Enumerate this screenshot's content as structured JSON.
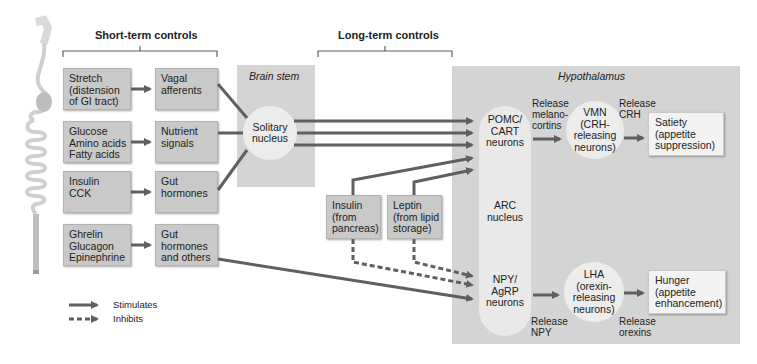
{
  "headings": {
    "short_term": "Short-term controls",
    "long_term": "Long-term controls"
  },
  "panels": {
    "brain_stem": "Brain stem",
    "hypothalamus": "Hypothalamus"
  },
  "inputs": [
    {
      "lines": [
        "Stretch",
        "(distension",
        "of GI tract)"
      ]
    },
    {
      "lines": [
        "Glucose",
        "Amino acids",
        "Fatty acids"
      ]
    },
    {
      "lines": [
        "Insulin",
        "CCK"
      ]
    },
    {
      "lines": [
        "Ghrelin",
        "Glucagon",
        "Epinephrine"
      ]
    }
  ],
  "signals": [
    {
      "lines": [
        "Vagal",
        "afferents"
      ]
    },
    {
      "lines": [
        "Nutrient",
        "signals"
      ]
    },
    {
      "lines": [
        "Gut",
        "hormones"
      ]
    },
    {
      "lines": [
        "Gut",
        "hormones",
        "and others"
      ]
    }
  ],
  "solitary_nucleus": {
    "lines": [
      "Solitary",
      "nucleus"
    ]
  },
  "long_term_inputs": [
    {
      "lines": [
        "Insulin",
        "(from",
        "pancreas)"
      ]
    },
    {
      "lines": [
        "Leptin",
        "(from lipid",
        "storage)"
      ]
    }
  ],
  "hypothalamus": {
    "pomc": {
      "lines": [
        "POMC/",
        "CART",
        "neurons"
      ]
    },
    "arc": {
      "lines": [
        "ARC",
        "nucleus"
      ]
    },
    "npy": {
      "lines": [
        "NPY/",
        "AgRP",
        "neurons"
      ]
    },
    "vmn": {
      "lines": [
        "VMN",
        "(CRH-",
        "releasing",
        "neurons)"
      ]
    },
    "lha": {
      "lines": [
        "LHA",
        "(orexin-",
        "releasing",
        "neurons)"
      ]
    },
    "release_melanocortins": {
      "lines": [
        "Release",
        "melano-",
        "cortins"
      ]
    },
    "release_crh": {
      "lines": [
        "Release",
        "CRH"
      ]
    },
    "release_npy": {
      "lines": [
        "Release",
        "NPY"
      ]
    },
    "release_orexins": {
      "lines": [
        "Release",
        "orexins"
      ]
    },
    "satiety": {
      "lines": [
        "Satiety",
        "(appetite",
        "suppression)"
      ]
    },
    "hunger": {
      "lines": [
        "Hunger",
        "(appetite",
        "enhancement)"
      ]
    }
  },
  "legend": {
    "stimulates": "Stimulates",
    "inhibits": "Inhibits"
  },
  "colors": {
    "arrow": "#5f5f5f",
    "box": "#c9c9c9",
    "panel": "#d4d4d4",
    "circle": "#ececec"
  }
}
